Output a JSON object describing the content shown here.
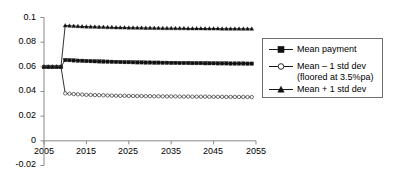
{
  "chart_data": {
    "type": "line",
    "title": "",
    "xlabel": "",
    "ylabel": "",
    "xlim": [
      2005,
      2055
    ],
    "ylim": [
      -0.02,
      0.1
    ],
    "xticks": [
      "2005",
      "2015",
      "2025",
      "2035",
      "2045",
      "2055"
    ],
    "yticks": [
      "0.1",
      "0.08",
      "0.06",
      "0.04",
      "0.02",
      "0",
      "-0.02"
    ],
    "grid": false,
    "legend_position": "right",
    "x": [
      2005,
      2006,
      2007,
      2008,
      2009,
      2010,
      2011,
      2012,
      2013,
      2014,
      2015,
      2016,
      2017,
      2018,
      2019,
      2020,
      2021,
      2022,
      2023,
      2024,
      2025,
      2026,
      2027,
      2028,
      2029,
      2030,
      2031,
      2032,
      2033,
      2034,
      2035,
      2036,
      2037,
      2038,
      2039,
      2040,
      2041,
      2042,
      2043,
      2044,
      2045,
      2046,
      2047,
      2048,
      2049,
      2050,
      2051,
      2052,
      2053,
      2054
    ],
    "series": [
      {
        "name": "Mean payment",
        "marker": "filled-square",
        "values": [
          0.06,
          0.06,
          0.06,
          0.06,
          0.06,
          0.0655,
          0.0654,
          0.0652,
          0.065,
          0.0649,
          0.0647,
          0.0646,
          0.0645,
          0.0644,
          0.0643,
          0.0642,
          0.0641,
          0.064,
          0.0639,
          0.0638,
          0.0638,
          0.0637,
          0.0636,
          0.0636,
          0.0635,
          0.0635,
          0.0634,
          0.0634,
          0.0633,
          0.0633,
          0.0632,
          0.0632,
          0.0631,
          0.0631,
          0.0631,
          0.063,
          0.063,
          0.063,
          0.0629,
          0.0629,
          0.0629,
          0.0628,
          0.0628,
          0.0628,
          0.0627,
          0.0627,
          0.0627,
          0.0627,
          0.0626,
          0.0626
        ]
      },
      {
        "name": "Mean – 1 std dev",
        "name_line2": "(floored at 3.5%pa)",
        "marker": "open-circle",
        "values": [
          0.06,
          0.06,
          0.06,
          0.06,
          0.06,
          0.0385,
          0.0382,
          0.0379,
          0.0377,
          0.0375,
          0.0373,
          0.0372,
          0.0371,
          0.037,
          0.0369,
          0.0368,
          0.0367,
          0.0366,
          0.0365,
          0.0365,
          0.0364,
          0.0364,
          0.0363,
          0.0363,
          0.0362,
          0.0362,
          0.0361,
          0.0361,
          0.0361,
          0.036,
          0.036,
          0.036,
          0.0359,
          0.0359,
          0.0359,
          0.0358,
          0.0358,
          0.0358,
          0.0358,
          0.0357,
          0.0357,
          0.0357,
          0.0357,
          0.0356,
          0.0356,
          0.0356,
          0.0356,
          0.0356,
          0.0355,
          0.0355
        ]
      },
      {
        "name": "Mean + 1 std dev",
        "marker": "filled-triangle",
        "values": [
          0.06,
          0.06,
          0.06,
          0.06,
          0.06,
          0.0935,
          0.0933,
          0.0931,
          0.0929,
          0.0927,
          0.0926,
          0.0925,
          0.0924,
          0.0923,
          0.0922,
          0.0921,
          0.092,
          0.0919,
          0.0918,
          0.0918,
          0.0917,
          0.0917,
          0.0916,
          0.0916,
          0.0915,
          0.0915,
          0.0914,
          0.0914,
          0.0913,
          0.0913,
          0.0913,
          0.0912,
          0.0912,
          0.0912,
          0.0911,
          0.0911,
          0.0911,
          0.0911,
          0.091,
          0.091,
          0.091,
          0.091,
          0.0909,
          0.0909,
          0.0909,
          0.0909,
          0.0909,
          0.0908,
          0.0908,
          0.0908
        ]
      }
    ],
    "colors": {
      "axis": "#8a8a8a",
      "line": "#1a1a1a",
      "legend_border": "#6f6f6f",
      "text": "#000000"
    }
  },
  "legend": {
    "items": [
      {
        "label": "Mean payment",
        "sub": ""
      },
      {
        "label": "Mean – 1 std dev",
        "sub": "(floored at 3.5%pa)"
      },
      {
        "label": "Mean + 1 std dev",
        "sub": ""
      }
    ]
  },
  "axes": {
    "y_tick_labels": [
      "0.1",
      "0.08",
      "0.06",
      "0.04",
      "0.02",
      "0",
      "-0.02"
    ],
    "x_tick_labels": [
      "2005",
      "2015",
      "2025",
      "2035",
      "2045",
      "2055"
    ]
  }
}
